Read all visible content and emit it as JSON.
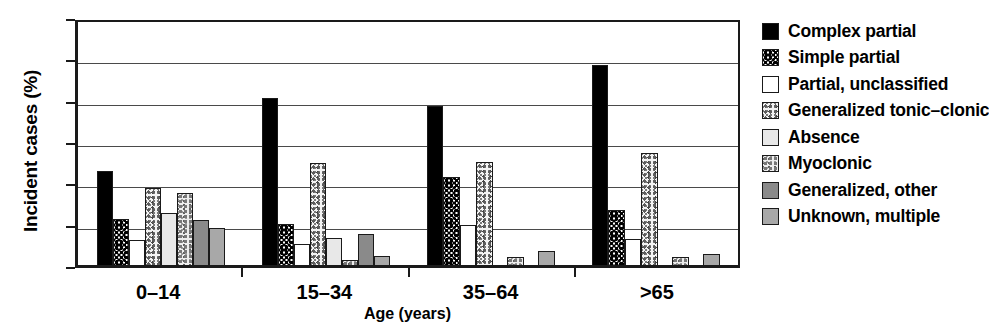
{
  "chart_data": {
    "type": "bar",
    "title": "",
    "xlabel": "Age (years)",
    "ylabel": "Incident cases (%)",
    "ylim": [
      0,
      60
    ],
    "yticks": [
      0,
      10,
      20,
      30,
      40,
      50,
      60
    ],
    "grid": true,
    "legend_position": "right",
    "categories": [
      "0–14",
      "15–34",
      "35–64",
      ">65"
    ],
    "series": [
      {
        "name": "Complex partial",
        "fill": "solid-black",
        "values": [
          22.8,
          40.4,
          38.5,
          48.3
        ]
      },
      {
        "name": "Simple partial",
        "fill": "coarse-speckle",
        "values": [
          11.1,
          10.0,
          21.3,
          13.2
        ]
      },
      {
        "name": "Partial, unclassified",
        "fill": "white",
        "values": [
          6.1,
          5.2,
          9.7,
          6.2
        ]
      },
      {
        "name": "Generalized tonic–clonic",
        "fill": "light-speckle",
        "values": [
          18.7,
          24.7,
          24.9,
          27.1
        ]
      },
      {
        "name": "Absence",
        "fill": "very-light-gray",
        "values": [
          12.5,
          6.5,
          0.0,
          0.0
        ]
      },
      {
        "name": "Myoclonic",
        "fill": "fine-speckle",
        "values": [
          17.4,
          1.3,
          1.9,
          1.9
        ]
      },
      {
        "name": "Generalized, other",
        "fill": "dark-gray",
        "values": [
          11.0,
          7.6,
          0.0,
          0.0
        ]
      },
      {
        "name": "Unknown, multiple",
        "fill": "medium-gray",
        "values": [
          9.0,
          2.2,
          3.5,
          2.7
        ]
      }
    ]
  },
  "axis": {
    "y_title": "Incident cases (%)",
    "x_title": "Age (years)",
    "y_ticks": [
      "60",
      "50",
      "40",
      "30",
      "20",
      "10",
      "0"
    ],
    "x_ticks": [
      "0–14",
      "15–34",
      "35–64",
      ">65"
    ]
  },
  "legend": {
    "items": [
      {
        "label": "Complex partial"
      },
      {
        "label": "Simple partial"
      },
      {
        "label": "Partial, unclassified"
      },
      {
        "label": "Generalized tonic–clonic"
      },
      {
        "label": "Absence"
      },
      {
        "label": "Myoclonic"
      },
      {
        "label": "Generalized, other"
      },
      {
        "label": "Unknown, multiple"
      }
    ]
  }
}
